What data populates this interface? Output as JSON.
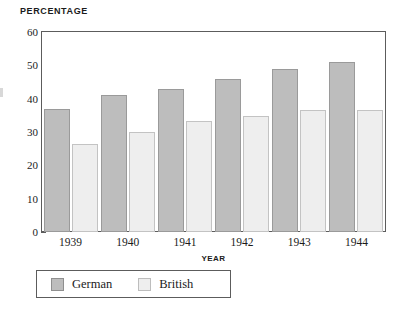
{
  "chart_data": {
    "type": "bar",
    "title": "Percentage",
    "xlabel": "Year",
    "ylabel": "",
    "categories": [
      "1939",
      "1940",
      "1941",
      "1942",
      "1943",
      "1944"
    ],
    "series": [
      {
        "name": "German",
        "color": "#bdbdbd",
        "values": [
          37,
          41,
          42.8,
          46,
          49,
          51
        ]
      },
      {
        "name": "British",
        "color": "#eeeeee",
        "values": [
          26.5,
          30,
          33.4,
          34.8,
          36.5,
          36.5
        ]
      }
    ],
    "ylim": [
      0,
      60
    ],
    "y_major_ticks": [
      0,
      10,
      20,
      30,
      40,
      50,
      60
    ],
    "y_minor_ticks": [
      5,
      15,
      25,
      35,
      45,
      55
    ],
    "y_tick_labels": [
      "0",
      "10",
      "20",
      "30",
      "40",
      "50",
      "60"
    ],
    "grid": false,
    "legend_position": "bottom-left",
    "legend": [
      "German",
      "British"
    ]
  },
  "legend": {
    "entries": [
      {
        "label": "German",
        "swatch": "german-swatch"
      },
      {
        "label": "British",
        "swatch": "british-swatch"
      }
    ]
  }
}
